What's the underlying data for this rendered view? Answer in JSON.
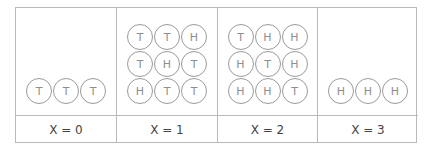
{
  "columns": [
    {
      "label": "X = 0",
      "coins": [
        "T",
        "T",
        "T"
      ]
    },
    {
      "label": "X = 1",
      "coins": [
        "T",
        "T",
        "H",
        "T",
        "H",
        "T",
        "H",
        "T",
        "T"
      ]
    },
    {
      "label": "X = 2",
      "coins": [
        "T",
        "H",
        "H",
        "H",
        "T",
        "H",
        "H",
        "H",
        "T"
      ]
    },
    {
      "label": "X = 3",
      "coins": [
        "H",
        "H",
        "H"
      ]
    }
  ]
}
